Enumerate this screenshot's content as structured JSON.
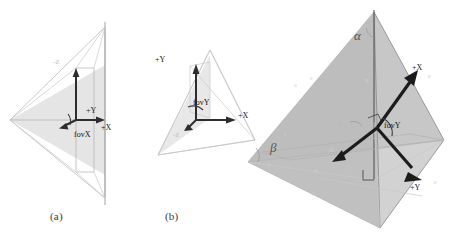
{
  "figure": {
    "background_color": "#ffffff",
    "captions": [
      {
        "key": "a",
        "text": "(a)"
      },
      {
        "key": "b",
        "text": "(b)"
      }
    ]
  },
  "panel_a": {
    "name": "top-down-frustum-view",
    "caption": "(a)",
    "labels": {
      "axis_x": "+X",
      "axis_y": "+Y",
      "axis_z": "-Z",
      "fov": "fovX"
    }
  },
  "panel_b": {
    "name": "side-frustum-view",
    "caption": "(b)",
    "labels": {
      "axis_x": "+X",
      "axis_y": "+Y",
      "axis_z": "-Z",
      "fov": "fovY"
    }
  },
  "panel_c": {
    "name": "perspective-frustum-view",
    "labels": {
      "axis_x": "+X",
      "axis_y": "+Y",
      "axis_z": "-Z",
      "fov": "fovY",
      "origin": "O",
      "angle_alpha": "α",
      "angle_beta": "β"
    }
  },
  "colors": {
    "background": "#ffffff",
    "axis_dark": "#1c1c1c",
    "line_light": "#b0b0b0",
    "fill_gray": "#c0c0c0",
    "label_text": "#1e1e1e",
    "label_faint": "#b9b9b9",
    "greek_text": "#555555"
  }
}
